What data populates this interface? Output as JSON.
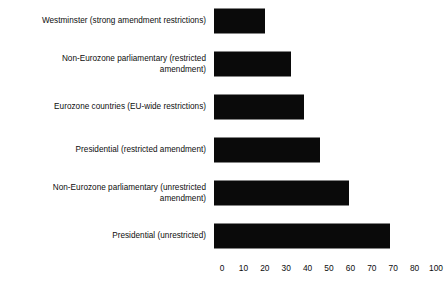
{
  "chart_data": {
    "type": "bar",
    "orientation": "horizontal",
    "title": "",
    "subtitle": "",
    "xlabel": "",
    "ylabel": "",
    "xlim": [
      0,
      100
    ],
    "grid": false,
    "legend": null,
    "bar_color": "#0a0a0a",
    "background_color": "#ffffff",
    "categories": [
      "Westminster (strong amendment restrictions)",
      "Non-Eurozone parliamentary (restricted\namendment)",
      "Eurozone countries (EU-wide restrictions)",
      "Presidential (restricted amendment)",
      "Non-Eurozone parliamentary (unrestricted\namendment)",
      "Presidential (unrestricted)"
    ],
    "values": [
      23,
      35,
      41,
      48,
      61,
      80
    ],
    "tick_labels": [
      "0",
      "10",
      "20",
      "30",
      "40",
      "50",
      "60",
      "70",
      "70",
      "80",
      "100"
    ]
  }
}
